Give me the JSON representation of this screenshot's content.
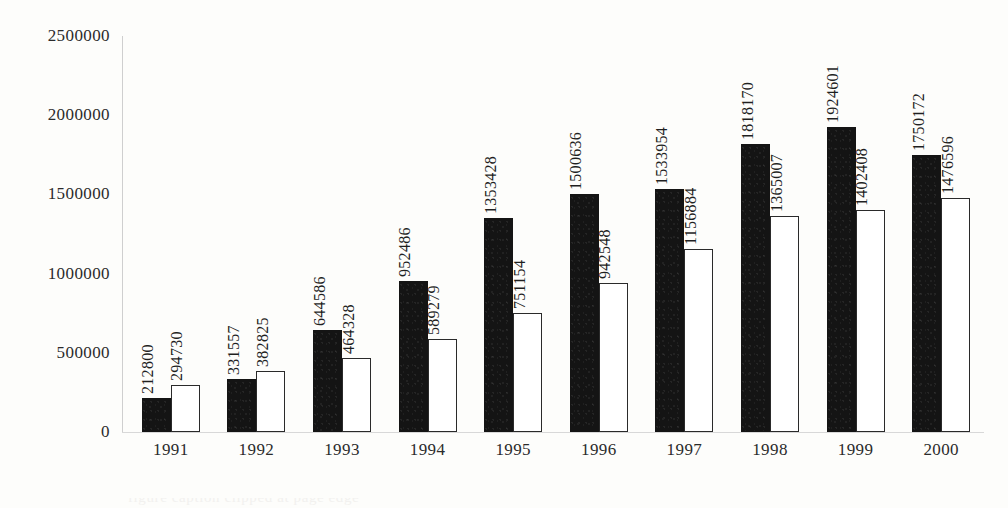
{
  "chart_data": {
    "type": "bar",
    "title": "",
    "xlabel": "",
    "ylabel": "",
    "categories": [
      "1991",
      "1992",
      "1993",
      "1994",
      "1995",
      "1996",
      "1997",
      "1998",
      "1999",
      "2000"
    ],
    "series": [
      {
        "name": "series-dark",
        "style": "filled-black",
        "values": [
          212800,
          331557,
          644586,
          952486,
          1353428,
          1500636,
          1533954,
          1818170,
          1924601,
          1750172
        ],
        "labels": [
          "212800",
          "331557",
          "644586",
          "952486",
          "1353428",
          "1500636",
          "1533954",
          "1818170",
          "1924601",
          "1750172"
        ]
      },
      {
        "name": "series-light",
        "style": "outlined-white",
        "values": [
          294730,
          382825,
          464328,
          589279,
          751154,
          942548,
          1156884,
          1365007,
          1402408,
          1476596
        ],
        "labels": [
          "294730",
          "382825",
          "464328",
          "589279",
          "751154",
          "942548",
          "1156884",
          "1365007",
          "1402408",
          "1476596"
        ]
      }
    ],
    "ylim": [
      0,
      2500000
    ],
    "y_ticks": [
      0,
      500000,
      1000000,
      1500000,
      2000000,
      2500000
    ],
    "y_tick_labels": [
      "0",
      "500000",
      "1000000",
      "1500000",
      "2000000",
      "2500000"
    ],
    "grid": false,
    "legend": "none",
    "data_labels": true,
    "data_label_rotation": 90
  },
  "axes": {
    "y_tick_labels": [
      "2500000",
      "2000000",
      "1500000",
      "1000000",
      "500000",
      "0"
    ],
    "x_tick_labels": [
      "1991",
      "1992",
      "1993",
      "1994",
      "1995",
      "1996",
      "1997",
      "1998",
      "1999",
      "2000"
    ]
  },
  "caption": {
    "clipped_text": "figure caption clipped at page edge"
  },
  "colors": {
    "background": "#fdfdfb",
    "ink": "#1a1a1a",
    "bar_dark": "#141414",
    "bar_light_fill": "#ffffff",
    "bar_light_stroke": "#2a2a2a",
    "axis_line": "#d0d0d0"
  }
}
